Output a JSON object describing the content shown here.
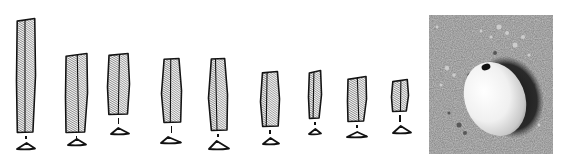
{
  "figure": {
    "colors": {
      "ink": "#111111",
      "paper": "#ffffff",
      "sediment": "#8a8a8a",
      "bead": "#f2f2f2"
    },
    "blades": [
      {
        "id": 1,
        "x": 16,
        "y": 18,
        "w": 20,
        "h": 115,
        "sx": 16,
        "sy": 142,
        "sw": 20,
        "sh": 8
      },
      {
        "id": 2,
        "x": 65,
        "y": 53,
        "w": 23,
        "h": 80,
        "sx": 67,
        "sy": 138,
        "sw": 20,
        "sh": 8
      },
      {
        "id": 3,
        "x": 107,
        "y": 53,
        "w": 23,
        "h": 62,
        "sx": 110,
        "sy": 127,
        "sw": 20,
        "sh": 8
      },
      {
        "id": 4,
        "x": 161,
        "y": 58,
        "w": 21,
        "h": 65,
        "sx": 160,
        "sy": 136,
        "sw": 22,
        "sh": 8
      },
      {
        "id": 5,
        "x": 208,
        "y": 58,
        "w": 20,
        "h": 73,
        "sx": 208,
        "sy": 140,
        "sw": 22,
        "sh": 10
      },
      {
        "id": 6,
        "x": 260,
        "y": 71,
        "w": 20,
        "h": 56,
        "sx": 262,
        "sy": 137,
        "sw": 18,
        "sh": 8
      },
      {
        "id": 7,
        "x": 308,
        "y": 70,
        "w": 14,
        "h": 49,
        "sx": 308,
        "sy": 128,
        "sw": 14,
        "sh": 7
      },
      {
        "id": 8,
        "x": 347,
        "y": 76,
        "w": 20,
        "h": 46,
        "sx": 346,
        "sy": 131,
        "sw": 22,
        "sh": 7
      },
      {
        "id": 9,
        "x": 391,
        "y": 79,
        "w": 18,
        "h": 33,
        "sx": 392,
        "sy": 125,
        "sw": 20,
        "sh": 9
      }
    ],
    "photo": {
      "subject": "perforated-bead",
      "background": "sediment"
    }
  }
}
